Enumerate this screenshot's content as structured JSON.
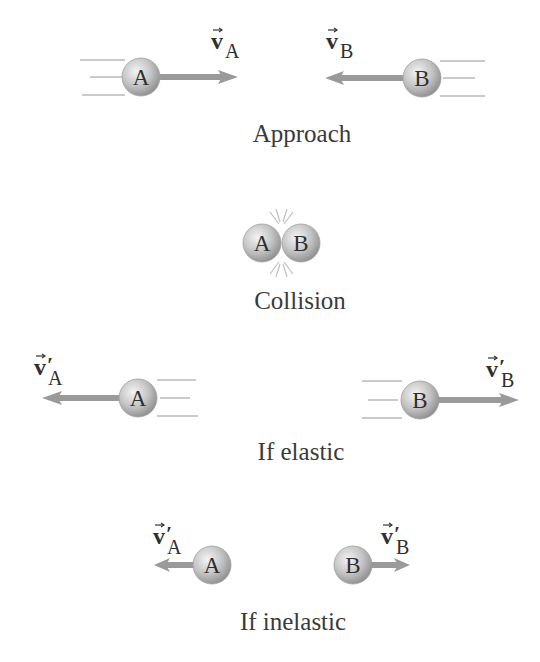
{
  "colors": {
    "ball_light": "#f0f0f0",
    "ball_dark": "#8f8f8f",
    "arrow": "#9a9a9a",
    "speed_lines": "#b5b5b5",
    "text": "#333333"
  },
  "panels": {
    "approach": {
      "caption": "Approach",
      "ball_a": {
        "label": "A"
      },
      "ball_b": {
        "label": "B"
      },
      "vec_a": {
        "symbol": "v",
        "subscript": "A",
        "prime": ""
      },
      "vec_b": {
        "symbol": "v",
        "subscript": "B",
        "prime": ""
      }
    },
    "collision": {
      "caption": "Collision",
      "ball_a": {
        "label": "A"
      },
      "ball_b": {
        "label": "B"
      }
    },
    "elastic": {
      "caption": "If elastic",
      "ball_a": {
        "label": "A"
      },
      "ball_b": {
        "label": "B"
      },
      "vec_a": {
        "symbol": "v",
        "subscript": "A",
        "prime": "′"
      },
      "vec_b": {
        "symbol": "v",
        "subscript": "B",
        "prime": "′"
      }
    },
    "inelastic": {
      "caption": "If inelastic",
      "ball_a": {
        "label": "A"
      },
      "ball_b": {
        "label": "B"
      },
      "vec_a": {
        "symbol": "v",
        "subscript": "A",
        "prime": "′"
      },
      "vec_b": {
        "symbol": "v",
        "subscript": "B",
        "prime": "′"
      }
    }
  }
}
